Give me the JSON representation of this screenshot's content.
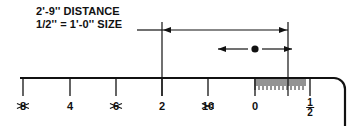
{
  "diagram": {
    "ink_color": "#111111",
    "background": "#ffffff"
  },
  "annotation": {
    "line1": "2'-9'' DISTANCE",
    "line2": "1/2'' = 1'-0'' SIZE",
    "leader_label": "leader-line"
  },
  "dimension": {
    "value": "2'-9''",
    "scale_ratio": "1/2'' = 1'-0''",
    "arrow_left_name": "dimension-arrow-left",
    "arrow_right_name": "dimension-arrow-right",
    "start_x": 162,
    "end_x": 288,
    "line_y": 30
  },
  "pointer": {
    "name": "center-point-marker",
    "x": 255,
    "y": 49,
    "left_arrow": "pointer-arrow-left",
    "right_arrow": "pointer-arrow-right"
  },
  "ruler": {
    "name": "architect-scale",
    "top_y": 78,
    "left_x": 20,
    "right_x": 345,
    "corner_radius": 11,
    "major_ticks": [
      {
        "label": "8",
        "x": 23,
        "struck": true,
        "tick_height": 18
      },
      {
        "label": "4",
        "x": 70,
        "struck": false,
        "tick_height": 18
      },
      {
        "label": "6",
        "x": 116,
        "struck": true,
        "tick_height": 18
      },
      {
        "label": "2",
        "x": 162,
        "struck": false,
        "tick_height": 18
      },
      {
        "label": "10",
        "x": 208,
        "struck": true,
        "tick_height": 18
      },
      {
        "label": "0",
        "x": 255,
        "struck": false,
        "tick_height": 18
      }
    ],
    "fraction_tick": {
      "label_numerator": "1",
      "label_denominator": "2",
      "x": 310,
      "tick_height": 18
    },
    "fine_graduations": {
      "start_x": 255,
      "end_x": 305,
      "count": 25,
      "tall_h": 11,
      "short_h": 7
    }
  }
}
